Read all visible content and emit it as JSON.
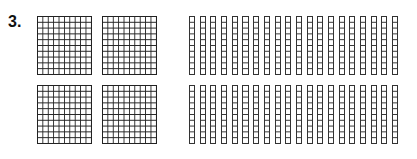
{
  "problem": {
    "number_label": "3.",
    "hundreds_blocks": {
      "count": 4,
      "grid": "10x10",
      "positions": [
        {
          "left": 37,
          "top": 16
        },
        {
          "left": 102,
          "top": 16
        },
        {
          "left": 37,
          "top": 85
        },
        {
          "left": 102,
          "top": 85
        }
      ]
    },
    "tens_rods": {
      "rows": [
        {
          "top": 16,
          "count": 20
        },
        {
          "top": 85,
          "count": 20
        }
      ],
      "cells_per_rod": 10
    },
    "colors": {
      "line": "#222222",
      "background": "#ffffff"
    }
  }
}
